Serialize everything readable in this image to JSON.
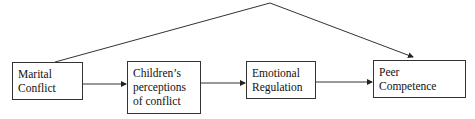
{
  "diagram": {
    "nodes": [
      {
        "id": "marital-conflict",
        "line1": "Marital",
        "line2": "Conflict",
        "line3": ""
      },
      {
        "id": "childrens-perceptions",
        "line1": "Children’s",
        "line2": "perceptions",
        "line3": "of conflict"
      },
      {
        "id": "emotional-regulation",
        "line1": "Emotional",
        "line2": "Regulation",
        "line3": ""
      },
      {
        "id": "peer-competence",
        "line1": "Peer",
        "line2": "Competence",
        "line3": ""
      }
    ],
    "edges": [
      {
        "from": "marital-conflict",
        "to": "childrens-perceptions"
      },
      {
        "from": "childrens-perceptions",
        "to": "emotional-regulation"
      },
      {
        "from": "emotional-regulation",
        "to": "peer-competence"
      },
      {
        "from": "marital-conflict",
        "to": "peer-competence",
        "style": "direct-arched"
      }
    ]
  }
}
